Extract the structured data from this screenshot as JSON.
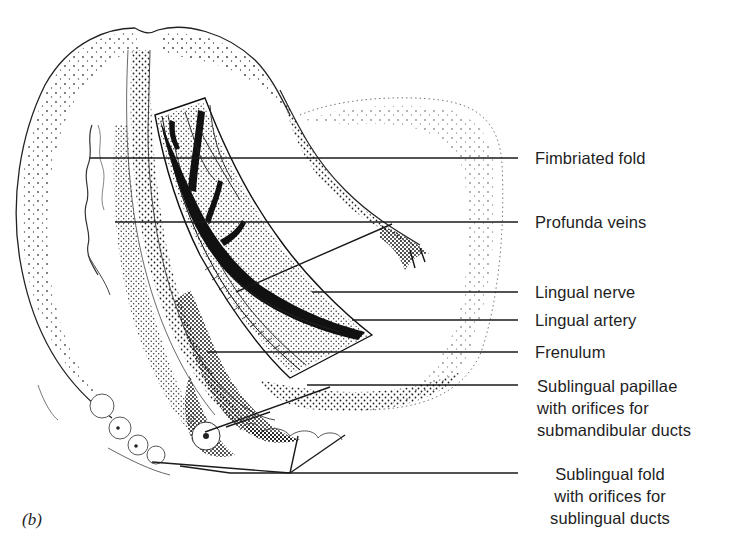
{
  "figure": {
    "panel_label": "(b)",
    "labels": [
      {
        "id": "fimbriated-fold",
        "text": "Fimbriated fold"
      },
      {
        "id": "profunda-veins",
        "text": "Profunda veins"
      },
      {
        "id": "lingual-nerve",
        "text": "Lingual nerve"
      },
      {
        "id": "lingual-artery",
        "text": "Lingual artery"
      },
      {
        "id": "frenulum",
        "text": "Frenulum"
      },
      {
        "id": "sublingual-papillae",
        "lines": [
          "Sublingual papillae",
          "with orifices for",
          "submandibular ducts"
        ]
      },
      {
        "id": "sublingual-fold",
        "lines": [
          "Sublingual fold",
          "with orifices for",
          "sublingual ducts"
        ]
      }
    ],
    "caption_clipped": "Figure (caption cut off at bottom edge)"
  },
  "colors": {
    "ink": "#1c1c1c",
    "paper": "#ffffff",
    "stipple": "#2a2a2a"
  }
}
